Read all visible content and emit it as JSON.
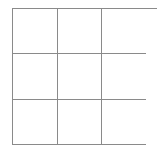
{
  "board": {
    "rows": 3,
    "cols": 3,
    "line_color": "#8a8a8a",
    "cells": [
      [
        "",
        "",
        ""
      ],
      [
        "",
        "",
        ""
      ],
      [
        "",
        "",
        ""
      ]
    ]
  }
}
